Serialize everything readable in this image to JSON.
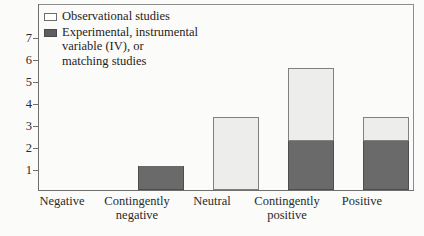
{
  "chart_data": {
    "type": "bar",
    "stacked": true,
    "title": "",
    "subtitle": "",
    "xlabel": "",
    "ylabel": "",
    "ylim": [
      0,
      7.6
    ],
    "yticks": [
      1,
      2,
      3,
      4,
      5,
      6,
      7
    ],
    "ytick_labels": [
      "1",
      "2",
      "3",
      "4",
      "5",
      "6",
      "7"
    ],
    "grid": false,
    "legend_position": "top-left inside plot",
    "categories": [
      "Negative",
      "Contingently negative",
      "Neutral",
      "Contingently positive",
      "Positive"
    ],
    "category_lines": [
      [
        "Negative"
      ],
      [
        "Contingently",
        "negative"
      ],
      [
        "Neutral"
      ],
      [
        "Contingently",
        "positive"
      ],
      [
        "Positive"
      ]
    ],
    "series": [
      {
        "name": "Observational studies",
        "key": "observational",
        "color": "#ededeb",
        "values": [
          0,
          0,
          3,
          3,
          1
        ]
      },
      {
        "name": "Experimental, instrumental variable (IV), or matching studies",
        "key": "experimental",
        "color": "#6a6a6a",
        "values": [
          0,
          1,
          0,
          2,
          2
        ]
      }
    ],
    "totals": [
      0,
      1,
      3,
      5,
      3
    ]
  },
  "legend": {
    "entries": [
      {
        "label": "Observational studies",
        "swatch": "light-swatch"
      },
      {
        "label": "Experimental, instrumental\nvariable (IV), or\nmatching studies",
        "swatch": "dark-swatch"
      }
    ]
  },
  "axes": {
    "y_tick_labels": [
      "7",
      "6",
      "5",
      "4",
      "3",
      "2",
      "1"
    ],
    "x_tick_labels": [
      "Negative",
      "Contingently\nnegative",
      "Neutral",
      "Contingently\npositive",
      "Positive"
    ]
  },
  "colors": {
    "observational_fill": "#ededeb",
    "experimental_fill": "#6a6a6a",
    "axis": "#6f6f6f",
    "frame": "#8d8d8d",
    "text": "#1d1d1d",
    "background": "#fbfbfa"
  }
}
